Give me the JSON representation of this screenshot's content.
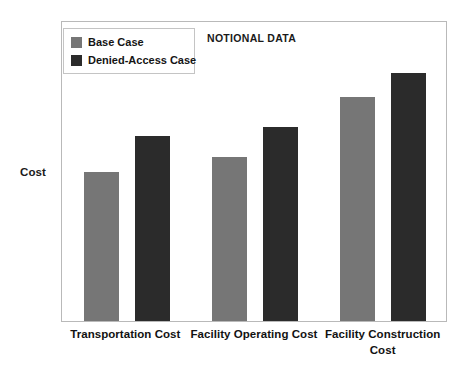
{
  "chart_data": {
    "type": "bar",
    "title": "",
    "annotation": "NOTIONAL DATA",
    "xlabel": "",
    "ylabel": "Cost",
    "grid": false,
    "legend_position": "top-left-inside",
    "ylim": [
      0,
      100
    ],
    "y_ticks_visible": false,
    "y_tick_labels": [],
    "categories": [
      "Transportation Cost",
      "Facility Operating Cost",
      "Facility Construction Cost"
    ],
    "series": [
      {
        "name": "Base Case",
        "color": "#767676",
        "values": [
          50,
          55,
          75
        ]
      },
      {
        "name": "Denied-Access Case",
        "color": "#2b2b2b",
        "values": [
          62,
          65,
          83
        ]
      }
    ]
  },
  "legend": {
    "items": [
      {
        "label": "Base Case",
        "color": "#767676"
      },
      {
        "label": "Denied-Access Case",
        "color": "#2b2b2b"
      }
    ]
  },
  "axes": {
    "y_title": "Cost",
    "category_labels": [
      "Transportation Cost",
      "Facility Operating Cost",
      "Facility Construction Cost"
    ]
  },
  "annotation": {
    "notional_data": "NOTIONAL DATA"
  },
  "colors": {
    "base_case": "#767676",
    "denied_access_case": "#2b2b2b",
    "plot_border": "#b9b9b9",
    "legend_border": "#c4c4c4",
    "text": "#141414",
    "background": "#ffffff"
  }
}
